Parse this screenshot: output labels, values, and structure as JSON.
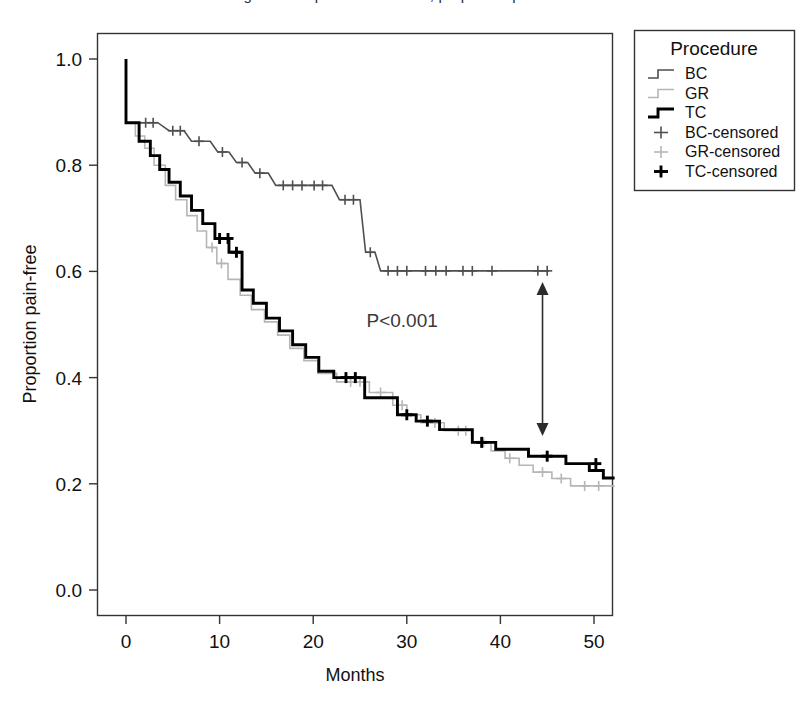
{
  "figure": {
    "cut_off_title": "Figure 2. Kaplan-Meier curve, proportion pain-free",
    "background_color": "#ffffff"
  },
  "chart_data": {
    "type": "line",
    "subtype": "kaplan-meier-step",
    "title": "",
    "xlabel": "Months",
    "ylabel": "Proportion pain-free",
    "xlim": [
      -2,
      54
    ],
    "ylim": [
      0.0,
      1.05
    ],
    "xticks": [
      0,
      10,
      20,
      30,
      40,
      50
    ],
    "xtick_labels": [
      "0",
      "10",
      "20",
      "30",
      "40",
      "50"
    ],
    "yticks": [
      0.0,
      0.2,
      0.4,
      0.6,
      0.8,
      1.0
    ],
    "ytick_labels": [
      "0.0",
      "0.2",
      "0.4",
      "0.6",
      "0.8",
      "1.0"
    ],
    "grid": false,
    "legend_position": "outside-top-right",
    "annotations": [
      {
        "name": "p-value",
        "text": "P<0.001",
        "x": 29.5,
        "y": 0.495
      },
      {
        "name": "difference-arrow",
        "type": "double-arrow",
        "x": 44.5,
        "y_top": 0.58,
        "y_bottom": 0.29
      }
    ],
    "series": [
      {
        "name": "BC",
        "label": "BC",
        "color": "#4f4f4f",
        "width": 1.6,
        "points": [
          [
            0,
            1.0
          ],
          [
            0,
            0.88
          ],
          [
            3.4,
            0.88
          ],
          [
            4.6,
            0.865
          ],
          [
            6.2,
            0.865
          ],
          [
            7.0,
            0.845
          ],
          [
            9.0,
            0.845
          ],
          [
            9.8,
            0.825
          ],
          [
            11.0,
            0.825
          ],
          [
            11.8,
            0.805
          ],
          [
            13.0,
            0.805
          ],
          [
            13.8,
            0.785
          ],
          [
            15.2,
            0.785
          ],
          [
            16.0,
            0.762
          ],
          [
            22.0,
            0.762
          ],
          [
            22.8,
            0.735
          ],
          [
            25.0,
            0.735
          ],
          [
            25.6,
            0.636
          ],
          [
            26.6,
            0.636
          ],
          [
            27.2,
            0.601
          ],
          [
            45.2,
            0.601
          ]
        ],
        "censor_marks": [
          [
            2.1,
            0.88
          ],
          [
            2.9,
            0.88
          ],
          [
            5.0,
            0.865
          ],
          [
            5.8,
            0.865
          ],
          [
            7.8,
            0.845
          ],
          [
            10.3,
            0.825
          ],
          [
            12.4,
            0.805
          ],
          [
            14.3,
            0.785
          ],
          [
            16.8,
            0.762
          ],
          [
            17.8,
            0.762
          ],
          [
            18.8,
            0.762
          ],
          [
            20.1,
            0.762
          ],
          [
            21.0,
            0.762
          ],
          [
            23.4,
            0.735
          ],
          [
            24.3,
            0.735
          ],
          [
            26.1,
            0.636
          ],
          [
            28.0,
            0.601
          ],
          [
            29.0,
            0.601
          ],
          [
            30.0,
            0.601
          ],
          [
            32.0,
            0.601
          ],
          [
            33.1,
            0.601
          ],
          [
            34.2,
            0.601
          ],
          [
            36.0,
            0.601
          ],
          [
            37.0,
            0.601
          ],
          [
            39.1,
            0.601
          ],
          [
            44.0,
            0.601
          ],
          [
            45.0,
            0.601
          ]
        ]
      },
      {
        "name": "GR",
        "label": "GR",
        "color": "#b6b6b6",
        "width": 1.6,
        "points": [
          [
            0,
            1.0
          ],
          [
            0,
            0.88
          ],
          [
            1.0,
            0.88
          ],
          [
            1.0,
            0.855
          ],
          [
            2.0,
            0.855
          ],
          [
            2.0,
            0.832
          ],
          [
            3.0,
            0.832
          ],
          [
            3.0,
            0.8
          ],
          [
            4.2,
            0.8
          ],
          [
            4.2,
            0.762
          ],
          [
            5.3,
            0.762
          ],
          [
            5.3,
            0.735
          ],
          [
            6.5,
            0.735
          ],
          [
            6.5,
            0.705
          ],
          [
            7.6,
            0.705
          ],
          [
            7.6,
            0.676
          ],
          [
            8.6,
            0.676
          ],
          [
            8.6,
            0.645
          ],
          [
            9.7,
            0.645
          ],
          [
            9.7,
            0.615
          ],
          [
            10.9,
            0.615
          ],
          [
            10.9,
            0.585
          ],
          [
            12.2,
            0.585
          ],
          [
            12.2,
            0.555
          ],
          [
            13.4,
            0.555
          ],
          [
            13.4,
            0.528
          ],
          [
            14.8,
            0.528
          ],
          [
            14.8,
            0.505
          ],
          [
            16.2,
            0.505
          ],
          [
            16.2,
            0.48
          ],
          [
            17.5,
            0.48
          ],
          [
            17.5,
            0.455
          ],
          [
            19.0,
            0.455
          ],
          [
            19.0,
            0.432
          ],
          [
            20.5,
            0.432
          ],
          [
            20.5,
            0.408
          ],
          [
            22.5,
            0.408
          ],
          [
            22.5,
            0.392
          ],
          [
            26.0,
            0.392
          ],
          [
            26.0,
            0.372
          ],
          [
            28.5,
            0.372
          ],
          [
            28.5,
            0.348
          ],
          [
            30.0,
            0.348
          ],
          [
            30.0,
            0.33
          ],
          [
            31.5,
            0.33
          ],
          [
            31.5,
            0.315
          ],
          [
            34.0,
            0.315
          ],
          [
            34.0,
            0.3
          ],
          [
            37.0,
            0.3
          ],
          [
            37.0,
            0.278
          ],
          [
            39.0,
            0.278
          ],
          [
            39.0,
            0.262
          ],
          [
            40.5,
            0.262
          ],
          [
            40.5,
            0.248
          ],
          [
            42.0,
            0.248
          ],
          [
            42.0,
            0.235
          ],
          [
            43.5,
            0.235
          ],
          [
            43.5,
            0.222
          ],
          [
            45.5,
            0.222
          ],
          [
            45.5,
            0.21
          ],
          [
            47.5,
            0.21
          ],
          [
            47.5,
            0.196
          ],
          [
            52.2,
            0.196
          ]
        ],
        "censor_marks": [
          [
            9.2,
            0.645
          ],
          [
            10.2,
            0.615
          ],
          [
            24.0,
            0.392
          ],
          [
            25.0,
            0.392
          ],
          [
            27.2,
            0.372
          ],
          [
            29.5,
            0.348
          ],
          [
            33.0,
            0.315
          ],
          [
            35.5,
            0.3
          ],
          [
            36.3,
            0.3
          ],
          [
            38.2,
            0.278
          ],
          [
            41.0,
            0.248
          ],
          [
            44.5,
            0.222
          ],
          [
            46.5,
            0.21
          ],
          [
            49.0,
            0.196
          ],
          [
            50.5,
            0.196
          ]
        ]
      },
      {
        "name": "TC",
        "label": "TC",
        "color": "#000000",
        "width": 2.9,
        "points": [
          [
            0,
            1.0
          ],
          [
            0,
            0.88
          ],
          [
            1.4,
            0.88
          ],
          [
            1.4,
            0.845
          ],
          [
            2.6,
            0.845
          ],
          [
            2.6,
            0.818
          ],
          [
            3.6,
            0.818
          ],
          [
            3.6,
            0.792
          ],
          [
            4.6,
            0.792
          ],
          [
            4.6,
            0.768
          ],
          [
            5.8,
            0.768
          ],
          [
            5.8,
            0.742
          ],
          [
            7.0,
            0.742
          ],
          [
            7.0,
            0.715
          ],
          [
            8.2,
            0.715
          ],
          [
            8.2,
            0.69
          ],
          [
            9.5,
            0.69
          ],
          [
            9.5,
            0.662
          ],
          [
            11.0,
            0.662
          ],
          [
            11.0,
            0.636
          ],
          [
            12.4,
            0.636
          ],
          [
            12.4,
            0.565
          ],
          [
            13.6,
            0.565
          ],
          [
            13.6,
            0.54
          ],
          [
            15.0,
            0.54
          ],
          [
            15.0,
            0.512
          ],
          [
            16.4,
            0.512
          ],
          [
            16.4,
            0.488
          ],
          [
            17.8,
            0.488
          ],
          [
            17.8,
            0.462
          ],
          [
            19.2,
            0.462
          ],
          [
            19.2,
            0.438
          ],
          [
            20.6,
            0.438
          ],
          [
            20.6,
            0.412
          ],
          [
            22.2,
            0.412
          ],
          [
            22.2,
            0.4
          ],
          [
            25.5,
            0.4
          ],
          [
            25.5,
            0.362
          ],
          [
            29.0,
            0.362
          ],
          [
            29.0,
            0.33
          ],
          [
            31.0,
            0.33
          ],
          [
            31.0,
            0.318
          ],
          [
            33.5,
            0.318
          ],
          [
            33.5,
            0.302
          ],
          [
            37.0,
            0.302
          ],
          [
            37.0,
            0.278
          ],
          [
            39.5,
            0.278
          ],
          [
            39.5,
            0.265
          ],
          [
            43.0,
            0.265
          ],
          [
            43.0,
            0.252
          ],
          [
            47.0,
            0.252
          ],
          [
            47.0,
            0.238
          ],
          [
            49.5,
            0.238
          ],
          [
            49.5,
            0.225
          ],
          [
            51.0,
            0.225
          ],
          [
            51.0,
            0.211
          ],
          [
            52.2,
            0.211
          ]
        ],
        "censor_marks": [
          [
            10.0,
            0.662
          ],
          [
            10.9,
            0.662
          ],
          [
            11.8,
            0.636
          ],
          [
            23.5,
            0.4
          ],
          [
            24.5,
            0.4
          ],
          [
            30.0,
            0.33
          ],
          [
            32.2,
            0.318
          ],
          [
            38.0,
            0.278
          ],
          [
            45.0,
            0.252
          ],
          [
            50.2,
            0.238
          ]
        ]
      }
    ],
    "legend": {
      "title": "Procedure",
      "entries": [
        {
          "label": "BC",
          "kind": "step",
          "color": "#4f4f4f",
          "width": 1.6
        },
        {
          "label": "GR",
          "kind": "step",
          "color": "#b6b6b6",
          "width": 1.6
        },
        {
          "label": "TC",
          "kind": "step",
          "color": "#000000",
          "width": 2.9
        },
        {
          "label": "BC-censored",
          "kind": "plus",
          "color": "#4f4f4f",
          "width": 1.6
        },
        {
          "label": "GR-censored",
          "kind": "plus",
          "color": "#b6b6b6",
          "width": 1.6
        },
        {
          "label": "TC-censored",
          "kind": "plus",
          "color": "#000000",
          "width": 2.9
        }
      ]
    }
  }
}
